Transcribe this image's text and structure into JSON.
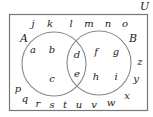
{
  "diagram": {
    "type": "venn",
    "universe_label": "U",
    "set_a_label": "A",
    "set_b_label": "B",
    "colors": {
      "border": "#777777",
      "circle": "#888888",
      "text": "#222222"
    },
    "regions": {
      "a_only": [
        "a",
        "b",
        "c"
      ],
      "a_and_b": [
        "d",
        "e"
      ],
      "b_only": [
        "f",
        "g",
        "h",
        "i"
      ],
      "outside": [
        "j",
        "k",
        "l",
        "m",
        "n",
        "o",
        "p",
        "q",
        "r",
        "s",
        "t",
        "u",
        "v",
        "w",
        "x",
        "y",
        "z"
      ]
    },
    "letters": [
      {
        "t": "j",
        "x": 33,
        "y": 27
      },
      {
        "t": "k",
        "x": 50,
        "y": 27
      },
      {
        "t": "l",
        "x": 71,
        "y": 27
      },
      {
        "t": "m",
        "x": 89,
        "y": 27
      },
      {
        "t": "n",
        "x": 108,
        "y": 27
      },
      {
        "t": "o",
        "x": 125,
        "y": 27
      },
      {
        "t": "a",
        "x": 33,
        "y": 53
      },
      {
        "t": "b",
        "x": 52,
        "y": 53
      },
      {
        "t": "c",
        "x": 52,
        "y": 82
      },
      {
        "t": "d",
        "x": 77,
        "y": 58
      },
      {
        "t": "e",
        "x": 77,
        "y": 77
      },
      {
        "t": "f",
        "x": 96,
        "y": 55
      },
      {
        "t": "g",
        "x": 116,
        "y": 55
      },
      {
        "t": "h",
        "x": 96,
        "y": 80
      },
      {
        "t": "i",
        "x": 116,
        "y": 80
      },
      {
        "t": "z",
        "x": 140,
        "y": 65
      },
      {
        "t": "y",
        "x": 136,
        "y": 82
      },
      {
        "t": "x",
        "x": 127,
        "y": 99
      },
      {
        "t": "p",
        "x": 18,
        "y": 92
      },
      {
        "t": "q",
        "x": 25,
        "y": 102
      },
      {
        "t": "r",
        "x": 38,
        "y": 107
      },
      {
        "t": "s",
        "x": 52,
        "y": 108
      },
      {
        "t": "t",
        "x": 65,
        "y": 108
      },
      {
        "t": "u",
        "x": 79,
        "y": 108
      },
      {
        "t": "v",
        "x": 94,
        "y": 108
      },
      {
        "t": "w",
        "x": 111,
        "y": 106
      }
    ]
  }
}
